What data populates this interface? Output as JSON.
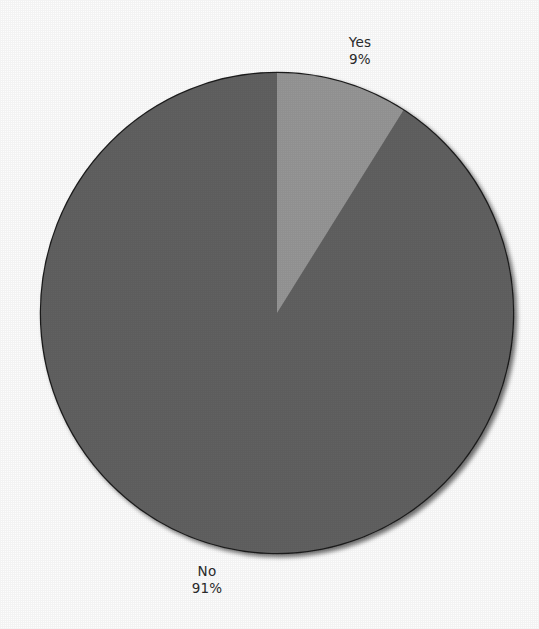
{
  "chart_data": {
    "type": "pie",
    "title": "",
    "subtitle": "",
    "xlabel": "",
    "ylabel": "",
    "grid": false,
    "legend": "none",
    "labels_inside": false,
    "start_angle_deg": 0,
    "direction": "clockwise",
    "categories": [
      "Yes",
      "No"
    ],
    "values": [
      9,
      91
    ],
    "units": "percent",
    "slices": [
      {
        "name": "Yes",
        "value": 9,
        "percent_text": "9%",
        "color": "#969696",
        "sweep_deg": 32.4,
        "label_position": "top-right"
      },
      {
        "name": "No",
        "value": 91,
        "percent_text": "91%",
        "color": "#616161",
        "sweep_deg": 327.6,
        "label_position": "bottom-left"
      }
    ]
  },
  "labels": {
    "yes": {
      "name": "Yes",
      "percent": "9%"
    },
    "no": {
      "name": "No",
      "percent": "91%"
    }
  },
  "colors": {
    "background": "#fdfdfd",
    "slice_light": "#969696",
    "slice_dark": "#616161",
    "outline": "#1d1d1d",
    "label_text": "#2b2b2b"
  }
}
